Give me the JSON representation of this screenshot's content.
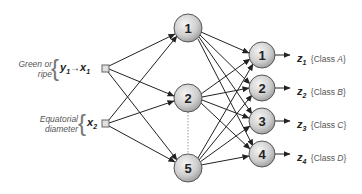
{
  "inputs": [
    {
      "id": "x1",
      "description_line1": "Green or",
      "description_line2": "ripe",
      "var_pre": "y",
      "var_pre_sub": "1",
      "arrow": "→",
      "var": "x",
      "var_sub": "1"
    },
    {
      "id": "x2",
      "description_line1": "Equatorial",
      "description_line2": "diameter",
      "var": "x",
      "var_sub": "2"
    }
  ],
  "hidden_layer": [
    {
      "label": "1"
    },
    {
      "label": "2"
    },
    {
      "label": "5"
    }
  ],
  "output_layer": [
    {
      "label": "1",
      "var": "z",
      "var_sub": "1",
      "class_prefix": "{Class ",
      "class_name": "A",
      "class_suffix": "}"
    },
    {
      "label": "2",
      "var": "z",
      "var_sub": "2",
      "class_prefix": "{Class ",
      "class_name": "B",
      "class_suffix": "}"
    },
    {
      "label": "3",
      "var": "z",
      "var_sub": "3",
      "class_prefix": "{Class ",
      "class_name": "C",
      "class_suffix": "}"
    },
    {
      "label": "4",
      "var": "z",
      "var_sub": "4",
      "class_prefix": "{Class ",
      "class_name": "D",
      "class_suffix": "}"
    }
  ],
  "colors": {
    "edge": "#222222",
    "node_fill_light": "#f2f2f2",
    "node_fill_dark": "#a8a8a8",
    "node_stroke": "#555555"
  }
}
